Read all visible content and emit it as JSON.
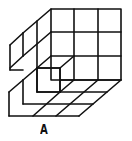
{
  "figure": {
    "label": "A"
  },
  "colors": {
    "stroke": "#111111",
    "background": "#ffffff"
  }
}
